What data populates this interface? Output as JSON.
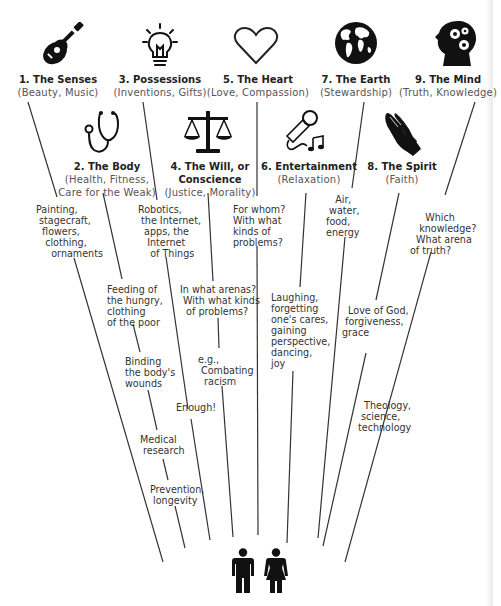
{
  "categories": [
    {
      "id": "senses",
      "title": "1. The Senses",
      "subtitle": "(Beauty, Music)",
      "icon": "guitar-icon",
      "notes": [
        "Painting,\n stagecraft,\n  flowers,\n   clothing,\n     ornaments"
      ]
    },
    {
      "id": "body",
      "title": "2. The Body",
      "subtitle": "(Health, Fitness,\nCare for the Weak)",
      "icon": "stethoscope-icon",
      "notes": [
        "Feeding of\nthe hungry,\nclothing\nof the poor",
        "Binding\nthe body's\nwounds",
        "Medical\n research",
        "Prevention,\n longevity"
      ]
    },
    {
      "id": "possessions",
      "title": "3. Possessions",
      "subtitle": "(Inventions, Gifts)",
      "icon": "lightbulb-icon",
      "notes": [
        "Robotics,\n the Internet,\n  apps, the\n   Internet\n    of Things",
        "Enough!"
      ]
    },
    {
      "id": "will",
      "title": "4. The Will, or\nConscience",
      "subtitle": "(Justice, Morality)",
      "icon": "scales-icon",
      "notes": [
        "In what arenas?\n With what kinds\n  of problems?",
        "e.g.,\n Combating\n  racism"
      ]
    },
    {
      "id": "heart",
      "title": "5. The Heart",
      "subtitle": "(Love, Compassion)",
      "icon": "heart-icon",
      "notes": [
        "For whom?\nWith what\nkinds of\nproblems?"
      ]
    },
    {
      "id": "entertainment",
      "title": "6. Entertainment",
      "subtitle": "(Relaxation)",
      "icon": "microphone-icon",
      "notes": [
        "Laughing,\nforgetting\none's cares,\ngaining\nperspective,\ndancing,\njoy"
      ]
    },
    {
      "id": "earth",
      "title": "7. The Earth",
      "subtitle": "(Stewardship)",
      "icon": "globe-icon",
      "notes": [
        "   Air,\n water,\nfood,\nenergy"
      ]
    },
    {
      "id": "spirit",
      "title": "8. The Spirit",
      "subtitle": "(Faith)",
      "icon": "praying-hands-icon",
      "notes": [
        "  Love of God,\n forgiveness,\ngrace"
      ]
    },
    {
      "id": "mind",
      "title": "9. The Mind",
      "subtitle": "(Truth, Knowledge)",
      "icon": "head-gears-icon",
      "notes": [
        "     Which\n   knowledge?\n  What arena\nof truth?",
        "  Theology,\n science,\ntechnology"
      ]
    }
  ],
  "people": {
    "icons": [
      "man-icon",
      "woman-icon"
    ]
  }
}
